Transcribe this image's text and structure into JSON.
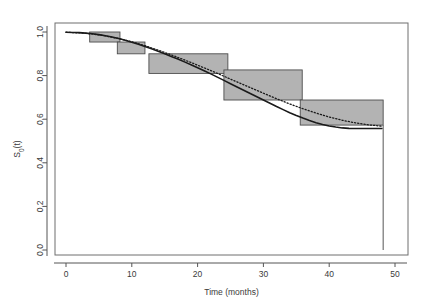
{
  "chart_data": {
    "type": "line",
    "title": "",
    "xlabel": "Time (months)",
    "ylabel": "S0(t)",
    "xlim": [
      -1.5,
      52
    ],
    "ylim": [
      0.0,
      1.03
    ],
    "xticks": [
      0,
      10,
      20,
      30,
      40,
      50
    ],
    "xticklabels": [
      "0",
      "10",
      "20",
      "30",
      "40",
      "50"
    ],
    "yticks": [
      0.0,
      0.2,
      0.4,
      0.6,
      0.8,
      1.0
    ],
    "yticklabels": [
      "0.0",
      "0.2",
      "0.4",
      "0.6",
      "0.8",
      "1.0"
    ],
    "grid": false,
    "legend": "none",
    "frame": true,
    "series": [
      {
        "name": "step-confidence-bands",
        "style": "filled-rectangles",
        "fill_color": "#b3b3b3",
        "edge_color": "#4d4d4d",
        "bands": [
          {
            "x0": 3.6,
            "x1": 8.2,
            "y0": 0.954,
            "y1": 1.0
          },
          {
            "x0": 7.8,
            "x1": 12.0,
            "y0": 0.9,
            "y1": 0.954
          },
          {
            "x0": 12.6,
            "x1": 24.6,
            "y0": 0.81,
            "y1": 0.9
          },
          {
            "x0": 24.0,
            "x1": 35.9,
            "y0": 0.688,
            "y1": 0.826
          },
          {
            "x0": 35.6,
            "x1": 48.2,
            "y0": 0.573,
            "y1": 0.688
          }
        ]
      },
      {
        "name": "fitted-survival-curve",
        "style": "solid",
        "color": "#1a1a1a",
        "width": 1.6,
        "points": [
          [
            0.0,
            0.999
          ],
          [
            1.0,
            0.998
          ],
          [
            2.0,
            0.997
          ],
          [
            3.0,
            0.995
          ],
          [
            4.0,
            0.992
          ],
          [
            5.0,
            0.988
          ],
          [
            6.0,
            0.983
          ],
          [
            7.0,
            0.977
          ],
          [
            8.0,
            0.97
          ],
          [
            9.0,
            0.962
          ],
          [
            10.0,
            0.953
          ],
          [
            11.0,
            0.944
          ],
          [
            12.0,
            0.934
          ],
          [
            13.0,
            0.923
          ],
          [
            14.0,
            0.912
          ],
          [
            15.0,
            0.9
          ],
          [
            16.0,
            0.888
          ],
          [
            17.0,
            0.876
          ],
          [
            18.0,
            0.863
          ],
          [
            19.0,
            0.85
          ],
          [
            20.0,
            0.836
          ],
          [
            21.0,
            0.822
          ],
          [
            22.0,
            0.808
          ],
          [
            23.0,
            0.793
          ],
          [
            24.0,
            0.778
          ],
          [
            25.0,
            0.763
          ],
          [
            26.0,
            0.748
          ],
          [
            27.0,
            0.733
          ],
          [
            28.0,
            0.718
          ],
          [
            29.0,
            0.703
          ],
          [
            30.0,
            0.688
          ],
          [
            31.0,
            0.673
          ],
          [
            32.0,
            0.658
          ],
          [
            33.0,
            0.644
          ],
          [
            34.0,
            0.63
          ],
          [
            35.0,
            0.617
          ],
          [
            36.0,
            0.605
          ],
          [
            37.0,
            0.594
          ],
          [
            38.0,
            0.584
          ],
          [
            39.0,
            0.576
          ],
          [
            40.0,
            0.569
          ],
          [
            41.0,
            0.564
          ],
          [
            42.0,
            0.56
          ],
          [
            43.0,
            0.558
          ],
          [
            44.0,
            0.557
          ],
          [
            45.0,
            0.557
          ],
          [
            46.0,
            0.557
          ],
          [
            47.0,
            0.557
          ],
          [
            48.0,
            0.557
          ]
        ]
      },
      {
        "name": "reference-dotted-curve",
        "style": "dotted",
        "color": "#1a1a1a",
        "width": 1.3,
        "points": [
          [
            0.0,
            0.999
          ],
          [
            2.0,
            0.996
          ],
          [
            4.0,
            0.991
          ],
          [
            6.0,
            0.982
          ],
          [
            8.0,
            0.97
          ],
          [
            10.0,
            0.955
          ],
          [
            12.0,
            0.937
          ],
          [
            14.0,
            0.917
          ],
          [
            16.0,
            0.895
          ],
          [
            18.0,
            0.872
          ],
          [
            20.0,
            0.848
          ],
          [
            22.0,
            0.823
          ],
          [
            24.0,
            0.797
          ],
          [
            26.0,
            0.771
          ],
          [
            28.0,
            0.745
          ],
          [
            30.0,
            0.719
          ],
          [
            32.0,
            0.694
          ],
          [
            34.0,
            0.67
          ],
          [
            36.0,
            0.648
          ],
          [
            38.0,
            0.628
          ],
          [
            40.0,
            0.61
          ],
          [
            42.0,
            0.595
          ],
          [
            44.0,
            0.583
          ],
          [
            46.0,
            0.574
          ],
          [
            48.0,
            0.568
          ]
        ]
      },
      {
        "name": "terminal-vertical-drop",
        "style": "solid",
        "color": "#555555",
        "width": 1.0,
        "points": [
          [
            48.2,
            0.573
          ],
          [
            48.2,
            0.0
          ]
        ]
      }
    ]
  }
}
